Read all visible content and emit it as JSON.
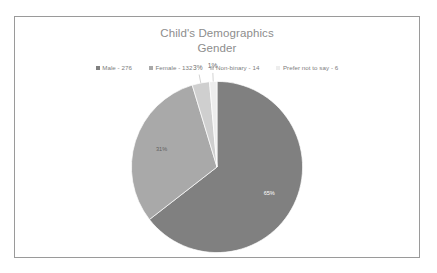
{
  "chart_data": {
    "type": "pie",
    "title": "Child's Demographics",
    "subtitle": "Gender",
    "title_lines": [
      "Child's Demographics",
      "Gender"
    ],
    "categories": [
      "Male",
      "Female",
      "Non-binary",
      "Prefer not to say"
    ],
    "values": [
      276,
      132,
      14,
      6
    ],
    "total": 428,
    "percent_labels": [
      "65%",
      "31%",
      "3%",
      "1%"
    ],
    "percents": [
      65,
      31,
      3,
      1
    ],
    "legend_entries": [
      "Male - 276",
      "Female - 132",
      "Non-binary - 14",
      "Prefer not to say - 6"
    ],
    "slice_colors": [
      "#808080",
      "#a9a9a9",
      "#cfcfcf",
      "#ededed"
    ],
    "label_text_colors": [
      "#ffffff",
      "#5f5f5f",
      "#6f6f6f",
      "#6f6f6f"
    ],
    "legend_position": "top",
    "start_angle_deg": 0,
    "direction": "clockwise",
    "grid": false,
    "xlabel": "",
    "ylabel": ""
  },
  "style": {
    "title_color": "#8d8d8d",
    "legend_text_color": "#7d7d7d",
    "border_color": "#9a9a9a",
    "background": "#ffffff",
    "leader_line_color": "#b5b5b5"
  },
  "labels": {
    "percent_male": "65%",
    "percent_female": "31%",
    "percent_nonbinary": "3%",
    "percent_prefer_not": "1%"
  }
}
